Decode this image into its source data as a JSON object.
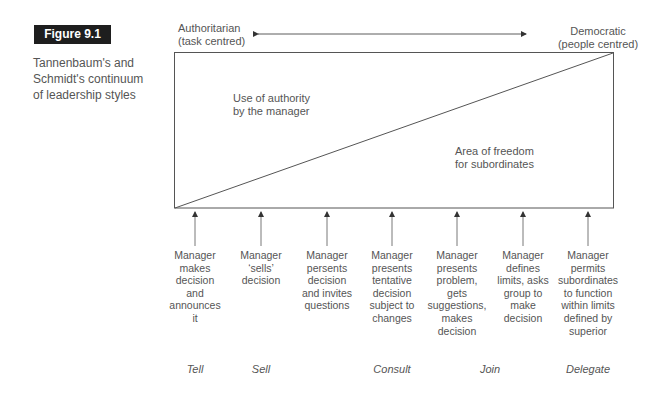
{
  "figure": {
    "number": "Figure 9.1",
    "caption": "Tannenbaum's and Schmidt's continuum of leadership styles"
  },
  "axis": {
    "left_pole": {
      "line1": "Authoritarian",
      "line2": "(task centred)"
    },
    "right_pole": {
      "line1": "Democratic",
      "line2": "(people centred)"
    }
  },
  "regions": {
    "manager_authority": {
      "line1": "Use of authority",
      "line2": "by the manager"
    },
    "subordinate_freedom": {
      "line1": "Area of freedom",
      "line2": "for subordinates"
    }
  },
  "behaviours": [
    {
      "x": 195,
      "text": "Manager makes decision and announces it"
    },
    {
      "x": 261,
      "text": "Manager 'sells' decision"
    },
    {
      "x": 327,
      "text": "Manager presents decision and invites questions"
    },
    {
      "x": 392,
      "text": "Manager presents tentative decision subject to changes"
    },
    {
      "x": 457,
      "text": "Manager presents problem, gets suggestions, makes decision"
    },
    {
      "x": 523,
      "text": "Manager defines limits, asks group to make decision"
    },
    {
      "x": 588,
      "text": "Manager permits subordinates to function within limits defined by superior"
    }
  ],
  "behaviour_lines": [
    [
      "Manager",
      "makes",
      "decision",
      "and",
      "announces",
      "it"
    ],
    [
      "Manager",
      "‘sells’",
      "decision"
    ],
    [
      "Manager",
      "persents",
      "decision",
      "and invites",
      "questions"
    ],
    [
      "Manager",
      "presents",
      "tentative",
      "decision",
      "subject to",
      "changes"
    ],
    [
      "Manager",
      "presents",
      "problem,",
      "gets",
      "suggestions,",
      "makes",
      "decision"
    ],
    [
      "Manager",
      "defines",
      "limits, asks",
      "group to",
      "make",
      "decision"
    ],
    [
      "Manager",
      "permits",
      "subordinates",
      "to function",
      "within limits",
      "defined by",
      "superior"
    ]
  ],
  "styles": [
    {
      "label": "Tell",
      "x": 195
    },
    {
      "label": "Sell",
      "x": 261
    },
    {
      "label": "Consult",
      "x": 392
    },
    {
      "label": "Join",
      "x": 490
    },
    {
      "label": "Delegate",
      "x": 588
    }
  ],
  "colors": {
    "line": "#555555",
    "badge_bg": "#1e1e1e",
    "text": "#555555"
  }
}
